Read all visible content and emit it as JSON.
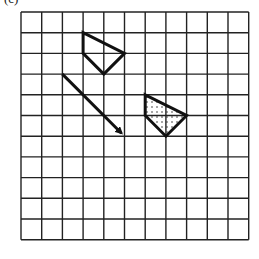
{
  "figure": {
    "label": "(c)",
    "grid": {
      "cols": 11,
      "rows": 11,
      "origin_px": [
        21,
        12
      ],
      "cell_px": 20.7,
      "line_color": "#222222"
    },
    "original_shape": {
      "name": "quadrilateral",
      "vertices": [
        [
          3,
          1
        ],
        [
          5,
          2
        ],
        [
          4,
          3
        ],
        [
          3,
          2
        ]
      ],
      "fill": "none"
    },
    "translation_arrow": {
      "from": [
        2,
        3
      ],
      "to": [
        5,
        6
      ],
      "vector": [
        3,
        3
      ]
    },
    "image_shape": {
      "name": "translated-quadrilateral",
      "vertices": [
        [
          6,
          4
        ],
        [
          8,
          5
        ],
        [
          7,
          6
        ],
        [
          6,
          5
        ]
      ],
      "fill": "dotted"
    },
    "stroke_color": "#111111"
  }
}
